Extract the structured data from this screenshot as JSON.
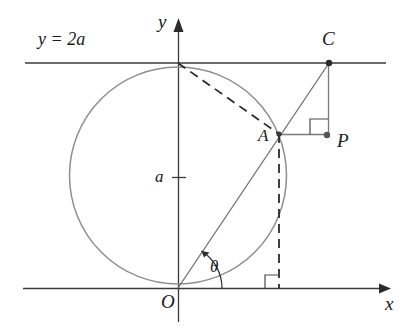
{
  "figure": {
    "labels": {
      "line_label": "y = 2a",
      "y_axis": "y",
      "x_axis": "x",
      "origin": "O",
      "radius_tick": "a",
      "point_a": "A",
      "point_c": "C",
      "point_p": "P",
      "angle": "θ"
    },
    "colors": {
      "axis": "#3a3a3a",
      "circle": "#8c8c8c",
      "ray": "#6b6b6b",
      "dashed": "#2b2b2b",
      "connector": "#7a7a7a",
      "text": "#1a1a1a",
      "background": "#ffffff"
    },
    "geometry": {
      "origin": {
        "x": 178,
        "y": 288
      },
      "circle": {
        "cx": 178,
        "cy": 175.5,
        "r": 108.5
      },
      "top_tangent_point": {
        "x": 178,
        "y": 63
      },
      "point_a": {
        "x": 279,
        "y": 134
      },
      "point_c": {
        "x": 329,
        "y": 63
      },
      "point_p": {
        "x": 325,
        "y": 135
      },
      "foot_of_a": {
        "x": 279,
        "y": 288
      },
      "line_2a_y": 63,
      "x_axis_y": 288,
      "y_axis_x": 178,
      "a_tick_y": 177,
      "angle_theta_degrees": 57
    }
  }
}
